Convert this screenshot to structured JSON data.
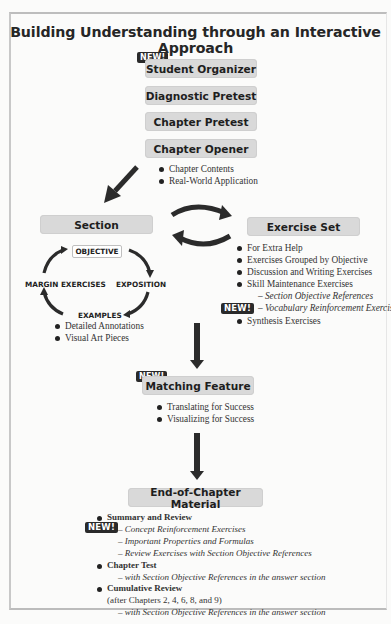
{
  "title": "Building Understanding through an Interactive Approach",
  "new_badge": "NEW!",
  "flow": {
    "student_organizer": "Student Organizer",
    "diagnostic_pretest": "Diagnostic Pretest",
    "chapter_pretest": "Chapter Pretest",
    "chapter_opener": {
      "label": "Chapter Opener",
      "bullets": [
        "Chapter Contents",
        "Real-World Application"
      ]
    },
    "section": {
      "label": "Section",
      "cycle": {
        "objective": "OBJECTIVE",
        "exposition": "EXPOSITION",
        "examples": "EXAMPLES",
        "margin_exercises": "MARGIN EXERCISES"
      },
      "bullets": [
        "Detailed Annotations",
        "Visual Art Pieces"
      ]
    },
    "exercise_set": {
      "label": "Exercise Set",
      "bullets": [
        "For Extra Help",
        "Exercises Grouped by Objective",
        "Discussion and Writing Exercises",
        "Skill Maintenance Exercises"
      ],
      "sub_items": [
        "– Section Objective References",
        "– Vocabulary Reinforcement Exercises"
      ],
      "last_bullet": "Synthesis Exercises"
    },
    "matching_feature": {
      "label": "Matching Feature",
      "bullets": [
        "Translating for Success",
        "Visualizing for Success"
      ]
    },
    "end_of_chapter": {
      "label": "End-of-Chapter Material",
      "summary_review": "Summary and Review",
      "summary_sub": [
        "– Concept Reinforcement Exercises",
        "– Important Properties and Formulas",
        "– Review Exercises with Section Objective References"
      ],
      "chapter_test": "Chapter Test",
      "chapter_test_sub": "– with Section Objective References in the answer section",
      "cumulative_review": "Cumulative Review",
      "cumulative_note": "(after Chapters 2, 4, 6, 8, and 9)",
      "cumulative_sub": "– with Section Objective References in the answer section"
    }
  },
  "colors": {
    "box_fill": "#d9d9d9",
    "arrow": "#2b2b2b",
    "badge": "#2a2a2a"
  }
}
